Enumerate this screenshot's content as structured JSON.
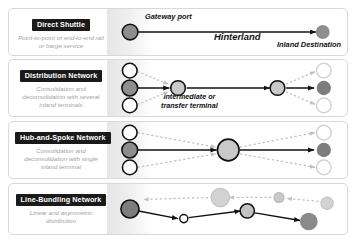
{
  "diagram": {
    "colors": {
      "node_dark": "#6e6e6e",
      "node_mid": "#9a9a9a",
      "node_light": "#c8c8c8",
      "node_white": "#ffffff",
      "node_stroke": "#111111",
      "arrow_solid": "#111111",
      "arrow_dashed": "#c0c0c0",
      "chip_bg": "#1a1a1a",
      "chip_text": "#ffffff",
      "subtitle_text": "#a2a2a2",
      "card_border": "#d8d8d8",
      "band": "#e6e6e6"
    },
    "annotations": {
      "gateway_port": "Gateway port",
      "hinterland": "Hinterland",
      "inland_destination": "Inland Destination",
      "intermediate_line1": "Intermediate or",
      "intermediate_line2": "transfer terminal"
    },
    "rows": [
      {
        "id": "direct-shuttle",
        "title": "Direct Shuttle",
        "subtitle": "Point-to-point or end-to-end rail or barge service"
      },
      {
        "id": "distribution-network",
        "title": "Distribution Network",
        "subtitle": "Consolidation and deconsolidation with several inland terminals"
      },
      {
        "id": "hub-and-spoke-network",
        "title": "Hub-and-Spoke Network",
        "subtitle": "Consolidation and deconsolidation with single inland terminal"
      },
      {
        "id": "line-bundling-network",
        "title": "Line-Bundling Network",
        "subtitle": "Linear and asymmetric distribution"
      }
    ]
  }
}
